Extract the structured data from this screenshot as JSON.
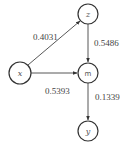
{
  "diagram": {
    "type": "path-diagram",
    "nodes": [
      {
        "id": "z",
        "label": "z",
        "cx": 88,
        "cy": 14,
        "r": 10
      },
      {
        "id": "x",
        "label": "x",
        "cx": 20,
        "cy": 73,
        "r": 11
      },
      {
        "id": "m",
        "label": "m",
        "cx": 88,
        "cy": 73,
        "r": 10
      },
      {
        "id": "y",
        "label": "y",
        "cx": 88,
        "cy": 131,
        "r": 10
      }
    ],
    "edges": [
      {
        "from": "x",
        "to": "z",
        "label": "0.4031"
      },
      {
        "from": "z",
        "to": "m",
        "label": "0.5486"
      },
      {
        "from": "x",
        "to": "m",
        "label": "0.5393"
      },
      {
        "from": "m",
        "to": "y",
        "label": "0.1339"
      }
    ],
    "colors": {
      "stroke": "#333333",
      "text": "#444444",
      "background": "#ffffff"
    }
  }
}
